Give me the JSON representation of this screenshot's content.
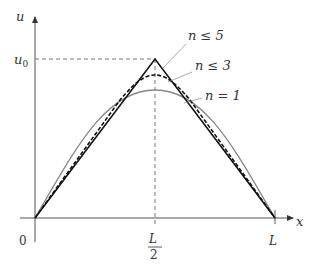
{
  "diagram": {
    "axes": {
      "x_label": "x",
      "y_label": "u",
      "origin_label": "0",
      "y_tick_label": "u",
      "y_tick_sub": "0",
      "x_tick_mid_num": "L",
      "x_tick_mid_den": "2",
      "x_tick_end": "L"
    },
    "curves": [
      {
        "label": "n ≤ 5",
        "style": "solid-black",
        "description": "triangular target"
      },
      {
        "label": "n ≤ 3",
        "style": "dashed-black"
      },
      {
        "label": "n = 1",
        "style": "solid-gray"
      }
    ],
    "annotations": {
      "label_n5": "n ≤ 5",
      "label_n3": "n ≤ 3",
      "label_n1": "n = 1"
    },
    "colors": {
      "axis": "#555555",
      "triangle": "#111111",
      "n3": "#111111",
      "n1": "#888888",
      "guide": "#666666"
    }
  }
}
